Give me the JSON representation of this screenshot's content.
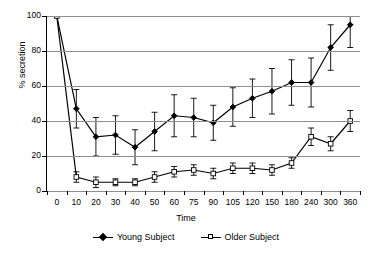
{
  "chart_data": {
    "type": "line",
    "title": "",
    "xlabel": "Time",
    "ylabel": "% secretion",
    "categories": [
      "0",
      "10",
      "20",
      "30",
      "40",
      "50",
      "60",
      "75",
      "90",
      "105",
      "120",
      "150",
      "180",
      "240",
      "300",
      "360"
    ],
    "ylim": [
      0,
      100
    ],
    "yticks": [
      0,
      20,
      40,
      60,
      80,
      100
    ],
    "grid": "horizontal",
    "legend_position": "bottom",
    "series": [
      {
        "name": "Young Subject",
        "marker": "filled-diamond",
        "values": [
          100,
          47,
          31,
          32,
          25,
          34,
          43,
          42,
          39,
          48,
          53,
          57,
          62,
          62,
          82,
          95
        ],
        "errors": [
          0,
          11,
          11,
          11,
          10,
          11,
          12,
          11,
          10,
          11,
          11,
          13,
          13,
          14,
          13,
          13
        ]
      },
      {
        "name": "Older Subject",
        "marker": "open-square",
        "values": [
          100,
          8,
          5,
          5,
          5,
          8,
          11,
          12,
          10,
          13,
          13,
          12,
          16,
          31,
          27,
          40
        ],
        "errors": [
          0,
          3,
          3,
          2,
          2,
          3,
          3,
          3,
          3,
          3,
          3,
          3,
          3,
          5,
          4,
          6
        ]
      }
    ]
  },
  "legend": {
    "items": [
      {
        "label": "Young Subject",
        "marker": "filled-diamond"
      },
      {
        "label": "Older Subject",
        "marker": "open-square"
      }
    ]
  },
  "axes": {
    "y_title": "% secretion",
    "x_title": "Time"
  }
}
